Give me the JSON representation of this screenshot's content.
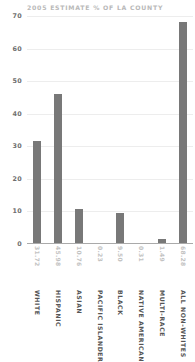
{
  "chart_data": {
    "type": "bar",
    "title": "2005 ESTIMATE % OF LA COUNTY",
    "xlabel": "",
    "ylabel": "",
    "ylim": [
      0,
      70
    ],
    "yticks": [
      0,
      10,
      20,
      30,
      40,
      50,
      60,
      70
    ],
    "grid": true,
    "legend": "none",
    "bar_color": "#787878",
    "categories": [
      "WHITE",
      "HISPANIC",
      "ASIAN",
      "PACIFIC ISLANDER",
      "BLACK",
      "NATIVE AMERICAN",
      "MULTI-RACE",
      "ALL NON-WHITES"
    ],
    "values": [
      31.72,
      45.98,
      10.76,
      0.23,
      9.5,
      0.31,
      1.49,
      68.28
    ],
    "value_labels": [
      "31.72",
      "45.98",
      "10.76",
      "0.23",
      "9.50",
      "0.31",
      "1.49",
      "68.28"
    ],
    "ytick_labels": [
      "0",
      "10",
      "20",
      "30",
      "40",
      "50",
      "60",
      "70"
    ]
  }
}
